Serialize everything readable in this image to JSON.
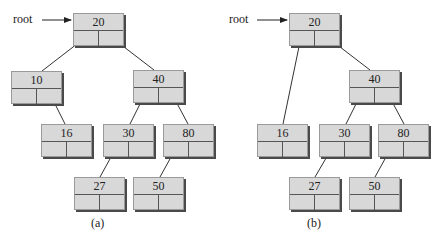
{
  "diagram": {
    "panels": [
      {
        "id": "a",
        "caption": "(a)",
        "root_label": "root",
        "nodes": [
          {
            "key": "n20",
            "value": "20"
          },
          {
            "key": "n10",
            "value": "10"
          },
          {
            "key": "n40",
            "value": "40"
          },
          {
            "key": "n16",
            "value": "16"
          },
          {
            "key": "n30",
            "value": "30"
          },
          {
            "key": "n80",
            "value": "80"
          },
          {
            "key": "n27",
            "value": "27"
          },
          {
            "key": "n50",
            "value": "50"
          }
        ],
        "edges": [
          [
            "20",
            "10",
            "left"
          ],
          [
            "20",
            "40",
            "right"
          ],
          [
            "10",
            "16",
            "right"
          ],
          [
            "40",
            "30",
            "left"
          ],
          [
            "40",
            "80",
            "right"
          ],
          [
            "30",
            "27",
            "left"
          ],
          [
            "80",
            "50",
            "left"
          ]
        ]
      },
      {
        "id": "b",
        "caption": "(b)",
        "root_label": "root",
        "nodes": [
          {
            "key": "n20",
            "value": "20"
          },
          {
            "key": "n40",
            "value": "40"
          },
          {
            "key": "n16",
            "value": "16"
          },
          {
            "key": "n30",
            "value": "30"
          },
          {
            "key": "n80",
            "value": "80"
          },
          {
            "key": "n27",
            "value": "27"
          },
          {
            "key": "n50",
            "value": "50"
          }
        ],
        "edges": [
          [
            "20",
            "16",
            "left"
          ],
          [
            "20",
            "40",
            "right"
          ],
          [
            "40",
            "30",
            "left"
          ],
          [
            "40",
            "80",
            "right"
          ],
          [
            "30",
            "27",
            "left"
          ],
          [
            "80",
            "50",
            "left"
          ]
        ]
      }
    ],
    "colors": {
      "node_fill": "#d8d8d8",
      "node_shadow": "#4a4a4a",
      "line": "#333333"
    }
  }
}
